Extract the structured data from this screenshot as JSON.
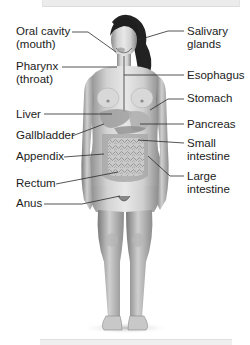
{
  "diagram": {
    "labels_left": [
      {
        "id": "oral-cavity",
        "line1": "Oral cavity",
        "line2": "(mouth)"
      },
      {
        "id": "pharynx",
        "line1": "Pharynx",
        "line2": "(throat)"
      },
      {
        "id": "liver",
        "line1": "Liver"
      },
      {
        "id": "gallbladder",
        "line1": "Gallbladder"
      },
      {
        "id": "appendix",
        "line1": "Appendix"
      },
      {
        "id": "rectum",
        "line1": "Rectum"
      },
      {
        "id": "anus",
        "line1": "Anus"
      }
    ],
    "labels_right": [
      {
        "id": "salivary-glands",
        "line1": "Salivary",
        "line2": "glands"
      },
      {
        "id": "esophagus",
        "line1": "Esophagus"
      },
      {
        "id": "stomach",
        "line1": "Stomach"
      },
      {
        "id": "pancreas",
        "line1": "Pancreas"
      },
      {
        "id": "small-intestine",
        "line1": "Small",
        "line2": "intestine"
      },
      {
        "id": "large-intestine",
        "line1": "Large",
        "line2": "intestine"
      }
    ],
    "colors": {
      "skin_light": "#e6e6e6",
      "skin_mid": "#b9b9b9",
      "skin_dark": "#7d7d7d",
      "hair": "#1e1e1e",
      "organs": "#a9a9a9",
      "leader_line": "#2a2a2a",
      "text": "#1c1c1c"
    }
  }
}
